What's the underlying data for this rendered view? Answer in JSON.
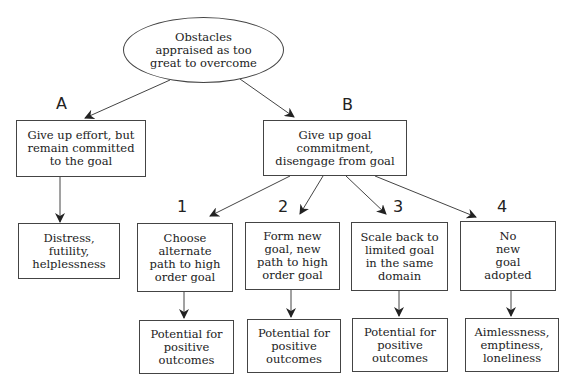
{
  "diagram": {
    "root": {
      "text": "Obstacles\nappraised as too\ngreat to overcome"
    },
    "branch_labels": {
      "a": "A",
      "b": "B"
    },
    "branch_a": {
      "action": "Give up effort, but\nremain committed\nto the goal",
      "outcome": "Distress,\nfutility,\nhelplessness"
    },
    "branch_b": {
      "action": "Give up goal\ncommitment,\ndisengage from goal",
      "options": [
        {
          "number": "1",
          "text": "Choose\nalternate\npath to high\norder goal",
          "outcome": "Potential for\npositive\noutcomes"
        },
        {
          "number": "2",
          "text": "Form new\ngoal, new\npath to high\norder goal",
          "outcome": "Potential for\npositive\noutcomes"
        },
        {
          "number": "3",
          "text": "Scale back to\nlimited goal\nin the same\ndomain",
          "outcome": "Potential for\npositive\noutcomes"
        },
        {
          "number": "4",
          "text": "No\nnew\ngoal\nadopted",
          "outcome": "Aimlessness,\nemptiness,\nloneliness"
        }
      ]
    },
    "colors": {
      "line": "#444444",
      "text": "#222222",
      "background": "#ffffff"
    }
  }
}
